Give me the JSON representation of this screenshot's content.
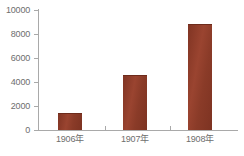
{
  "chart_data": {
    "type": "bar",
    "title": "",
    "xlabel": "",
    "ylabel": "",
    "categories": [
      "1906年",
      "1907年",
      "1908年"
    ],
    "values": [
      1400,
      4580,
      8830
    ],
    "ylim": [
      0,
      10000
    ],
    "ytick_labels": [
      "10000",
      "8000",
      "6000",
      "4000",
      "2000",
      "0"
    ],
    "ytick_values": [
      10000,
      8000,
      6000,
      4000,
      2000,
      0
    ],
    "grid": false,
    "legend": null,
    "bar_color": "#8e3a26",
    "axis_color": "#a9a9a9",
    "text_color": "#6e6e6e",
    "background_color": "#ffffff"
  },
  "axis": {
    "y_labels": {
      "t0": "10000",
      "t1": "8000",
      "t2": "6000",
      "t3": "4000",
      "t4": "2000",
      "t5": "0"
    },
    "x_labels": {
      "c0": "1906年",
      "c1": "1907年",
      "c2": "1908年"
    }
  }
}
